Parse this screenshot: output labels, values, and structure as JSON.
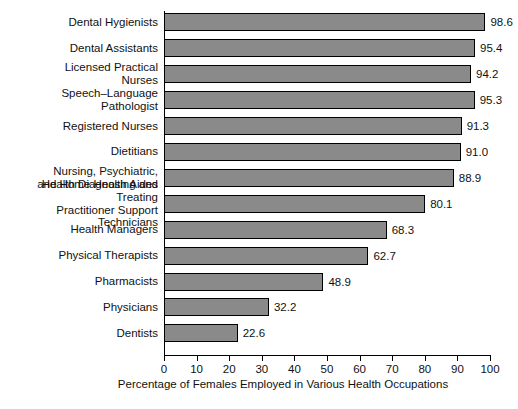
{
  "chart_data": {
    "type": "bar",
    "orientation": "horizontal",
    "title": "",
    "xlabel": "Percentage of Females Employed in Various Health Occupations",
    "ylabel": "",
    "xlim": [
      0,
      100
    ],
    "xticks": [
      0,
      10,
      20,
      30,
      40,
      50,
      60,
      70,
      80,
      90,
      100
    ],
    "grid": false,
    "legend": null,
    "bar_color": "#8a8a8a",
    "bar_edge_color": "#000000",
    "value_label_format": "one-decimal",
    "categories": [
      "Dental Hygienists",
      "Dental Assistants",
      "Licensed Practical\nNurses",
      "Speech–Language\nPathologist",
      "Registered Nurses",
      "Dietitians",
      "Nursing, Psychiatric,\nand Home Health Aides",
      "Health Diagnosing and Treating\nPractitioner Support Technicians",
      "Health Managers",
      "Physical Therapists",
      "Pharmacists",
      "Physicians",
      "Dentists"
    ],
    "values": [
      98.6,
      95.4,
      94.2,
      95.3,
      91.3,
      91.0,
      88.9,
      80.1,
      68.3,
      62.7,
      48.9,
      32.2,
      22.6
    ],
    "value_labels": [
      "98.6",
      "95.4",
      "94.2",
      "95.3",
      "91.3",
      "91.0",
      "88.9",
      "80.1",
      "68.3",
      "62.7",
      "48.9",
      "32.2",
      "22.6"
    ],
    "xtick_labels": [
      "0",
      "10",
      "20",
      "30",
      "40",
      "50",
      "60",
      "70",
      "80",
      "90",
      "100"
    ]
  }
}
